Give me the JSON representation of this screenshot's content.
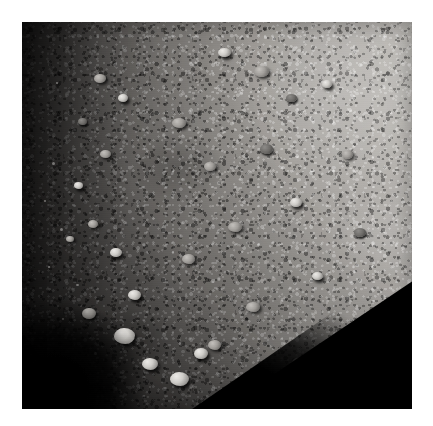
{
  "page": {
    "background_color": "#ffffff",
    "type": "single-image-view"
  },
  "image": {
    "alt": "Close-up grayscale spacecraft image of a rubble-pile asteroid surface",
    "subject": "asteroid-surface",
    "capture_mode": "grayscale",
    "frame": {
      "x": 22,
      "y": 22,
      "width": 390,
      "height": 387
    },
    "background_color": "#030303",
    "palette": {
      "space_black": "#030303",
      "terminator_shadow": "#111010",
      "regolith_dark": "#3c3b3a",
      "regolith_mid": "#8d8b88",
      "regolith_light": "#b9b6b1",
      "boulder_highlight": "#eceae7"
    },
    "lighting": {
      "sun_direction": "upper-right",
      "terminator_edge": "left and lower-left limb",
      "shadow_wedge": "lower-right corner"
    },
    "features": [
      {
        "name": "illuminated-limb",
        "position": "upper-left to lower-left"
      },
      {
        "name": "boulder-field",
        "position": "center"
      },
      {
        "name": "bright-boulder-cluster",
        "position": "lower-left terminator"
      },
      {
        "name": "night-side-wedge",
        "position": "bottom-right corner"
      },
      {
        "name": "bright-regolith-patch",
        "position": "upper-right"
      }
    ]
  }
}
